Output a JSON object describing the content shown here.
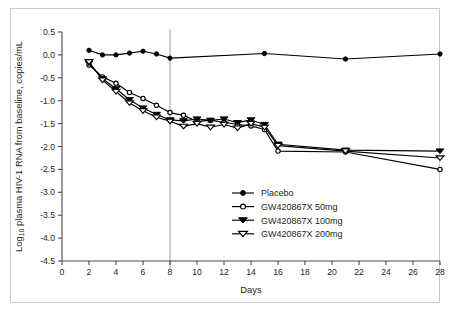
{
  "chart_data": {
    "type": "line",
    "title": "",
    "xlabel": "Days",
    "ylabel": "Log10 plasma HIV-1 RNA from baseline, copies/mL",
    "ylabel_prefix": "Log",
    "ylabel_subscript": "10",
    "ylabel_rest": " plasma HIV-1 RNA from baseline, copies/mL",
    "xlim": [
      0,
      28
    ],
    "ylim": [
      -4.5,
      0.5
    ],
    "xticks": [
      0,
      2,
      4,
      6,
      8,
      10,
      12,
      14,
      16,
      18,
      20,
      22,
      24,
      26,
      28
    ],
    "yticks": [
      0.5,
      0.0,
      -0.5,
      -1.0,
      -1.5,
      -2.0,
      -2.5,
      -3.0,
      -3.5,
      -4.0,
      -4.5
    ],
    "ytick_labels": [
      "0.5",
      "0.0",
      "-0.5",
      "-1.0",
      "-1.5",
      "-2.0",
      "-2.5",
      "-3.0",
      "-3.5",
      "-4.0",
      "-4.5"
    ],
    "xtick_labels": [
      "0",
      "2",
      "4",
      "6",
      "8",
      "10",
      "12",
      "14",
      "16",
      "18",
      "20",
      "22",
      "24",
      "26",
      "28"
    ],
    "grid": false,
    "legend_position": "lower-right",
    "annotations": [
      {
        "name": "treatment-end-reference-line",
        "type": "vline",
        "x": 8,
        "color": "#9a9a9a"
      }
    ],
    "series": [
      {
        "name": "Placebo",
        "marker": "filled-circle",
        "color": "#000000",
        "x": [
          2,
          3,
          4,
          5,
          6,
          7,
          8,
          15,
          21,
          28
        ],
        "values": [
          0.1,
          0.0,
          0.0,
          0.04,
          0.08,
          0.02,
          -0.07,
          0.03,
          -0.09,
          0.02
        ]
      },
      {
        "name": "GW420867X 50mg",
        "marker": "open-circle",
        "color": "#000000",
        "x": [
          2,
          3,
          4,
          5,
          6,
          7,
          8,
          9,
          10,
          11,
          12,
          13,
          14,
          15,
          16,
          21,
          28
        ],
        "values": [
          -0.22,
          -0.48,
          -0.62,
          -0.82,
          -0.95,
          -1.1,
          -1.26,
          -1.32,
          -1.45,
          -1.43,
          -1.47,
          -1.52,
          -1.55,
          -1.63,
          -2.1,
          -2.12,
          -2.5
        ]
      },
      {
        "name": "GW420867X 100mg",
        "marker": "filled-triangle-down",
        "color": "#000000",
        "x": [
          2,
          3,
          4,
          5,
          6,
          7,
          8,
          9,
          10,
          11,
          12,
          13,
          14,
          15,
          16,
          21,
          28
        ],
        "values": [
          -0.18,
          -0.52,
          -0.74,
          -0.98,
          -1.16,
          -1.3,
          -1.42,
          -1.44,
          -1.4,
          -1.43,
          -1.4,
          -1.48,
          -1.42,
          -1.52,
          -1.95,
          -2.08,
          -2.1
        ]
      },
      {
        "name": "GW420867X 200mg",
        "marker": "open-triangle-down",
        "color": "#000000",
        "x": [
          2,
          3,
          4,
          5,
          6,
          7,
          8,
          9,
          10,
          11,
          12,
          13,
          14,
          15,
          16,
          21,
          28
        ],
        "values": [
          -0.15,
          -0.55,
          -0.8,
          -1.05,
          -1.22,
          -1.36,
          -1.45,
          -1.56,
          -1.5,
          -1.58,
          -1.52,
          -1.6,
          -1.5,
          -1.58,
          -1.98,
          -2.1,
          -2.25
        ]
      }
    ]
  },
  "legend": {
    "items": [
      {
        "label": "Placebo",
        "marker": "filled-circle"
      },
      {
        "label": "GW420867X 50mg",
        "marker": "open-circle"
      },
      {
        "label": "GW420867X 100mg",
        "marker": "filled-triangle-down"
      },
      {
        "label": "GW420867X 200mg",
        "marker": "open-triangle-down"
      }
    ]
  }
}
